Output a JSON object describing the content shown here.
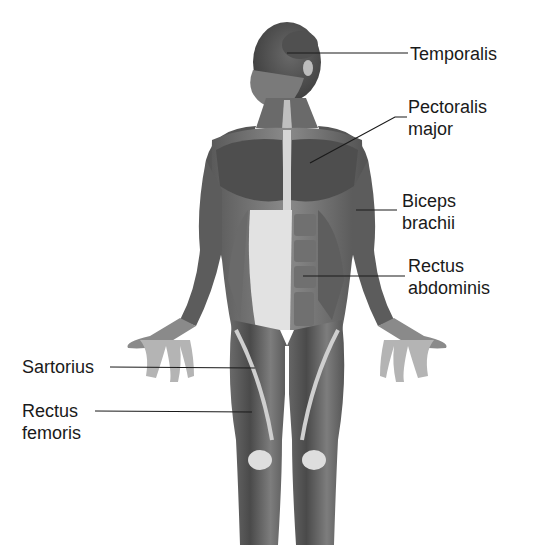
{
  "figure": {
    "colors": {
      "background": "#ffffff",
      "leader_line": "#1a1a1a",
      "text": "#1a1a1a",
      "muscle_dark": "#4a4a4a",
      "muscle_mid": "#7a7a7a",
      "tendon_light": "#e6e6e6"
    }
  },
  "labels": [
    {
      "id": "temporalis",
      "lines": [
        "Temporalis"
      ],
      "side": "right"
    },
    {
      "id": "pectoralis-major",
      "lines": [
        "Pectoralis",
        "major"
      ],
      "side": "right"
    },
    {
      "id": "biceps-brachii",
      "lines": [
        "Biceps",
        "brachii"
      ],
      "side": "right"
    },
    {
      "id": "rectus-abdominis",
      "lines": [
        "Rectus",
        "abdominis"
      ],
      "side": "right"
    },
    {
      "id": "sartorius",
      "lines": [
        "Sartorius"
      ],
      "side": "left"
    },
    {
      "id": "rectus-femoris",
      "lines": [
        "Rectus",
        "femoris"
      ],
      "side": "left"
    }
  ]
}
